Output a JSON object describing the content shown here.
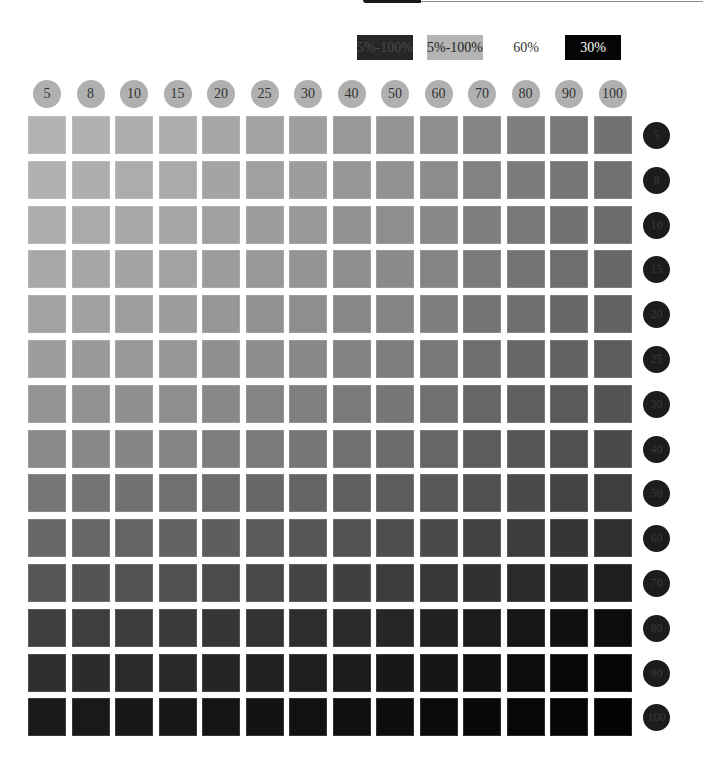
{
  "legend": [
    {
      "label": "5%-100%",
      "bg": "#262626",
      "fg": "#4a4a4a"
    },
    {
      "label": "5%-100%",
      "bg": "#b4b4b4",
      "fg": "#222222"
    },
    {
      "label": "60%",
      "bg": "#ffffff",
      "fg": "#333333"
    },
    {
      "label": "30%",
      "bg": "#050505",
      "fg": "#ffffff"
    }
  ],
  "chart_data": {
    "type": "heatmap",
    "title": "",
    "xlabel": "",
    "ylabel": "",
    "column_labels": [
      "5",
      "8",
      "10",
      "15",
      "20",
      "25",
      "30",
      "40",
      "50",
      "60",
      "70",
      "80",
      "90",
      "100"
    ],
    "row_labels": [
      "5",
      "8",
      "10",
      "15",
      "20",
      "25",
      "30",
      "40",
      "50",
      "60",
      "70",
      "80",
      "90",
      "100"
    ],
    "legend": [
      "5%-100%",
      "5%-100%",
      "60%",
      "30%"
    ],
    "values_gray_level": [
      [
        178,
        176,
        174,
        172,
        166,
        162,
        158,
        152,
        148,
        142,
        132,
        126,
        120,
        114
      ],
      [
        176,
        174,
        172,
        170,
        164,
        160,
        156,
        150,
        146,
        140,
        130,
        124,
        118,
        112
      ],
      [
        172,
        170,
        168,
        166,
        160,
        156,
        152,
        146,
        142,
        136,
        126,
        120,
        114,
        108
      ],
      [
        168,
        166,
        164,
        162,
        156,
        152,
        148,
        142,
        138,
        132,
        122,
        116,
        110,
        104
      ],
      [
        162,
        160,
        158,
        156,
        150,
        146,
        142,
        136,
        132,
        126,
        116,
        110,
        104,
        98
      ],
      [
        156,
        154,
        152,
        150,
        144,
        140,
        136,
        130,
        126,
        120,
        110,
        104,
        98,
        92
      ],
      [
        148,
        146,
        144,
        142,
        136,
        132,
        128,
        122,
        118,
        112,
        102,
        96,
        90,
        84
      ],
      [
        138,
        136,
        134,
        132,
        126,
        122,
        118,
        112,
        108,
        102,
        92,
        86,
        80,
        74
      ],
      [
        118,
        116,
        114,
        112,
        108,
        104,
        100,
        96,
        92,
        88,
        80,
        74,
        68,
        62
      ],
      [
        104,
        102,
        100,
        98,
        94,
        90,
        86,
        82,
        78,
        74,
        66,
        60,
        54,
        48
      ],
      [
        86,
        84,
        82,
        80,
        76,
        72,
        68,
        64,
        60,
        56,
        48,
        42,
        36,
        30
      ],
      [
        64,
        62,
        60,
        58,
        54,
        50,
        46,
        42,
        38,
        34,
        28,
        22,
        16,
        12
      ],
      [
        46,
        44,
        42,
        40,
        36,
        33,
        30,
        27,
        24,
        21,
        16,
        12,
        8,
        5
      ],
      [
        26,
        25,
        24,
        23,
        21,
        19,
        17,
        15,
        13,
        11,
        9,
        7,
        5,
        3
      ]
    ]
  }
}
